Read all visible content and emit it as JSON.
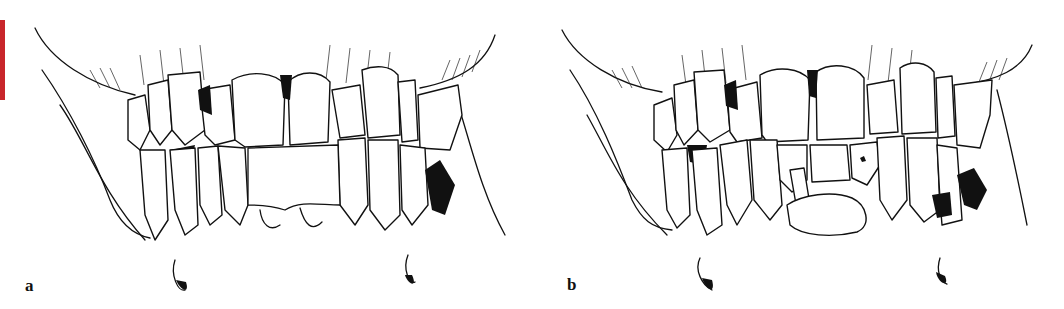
{
  "figure": {
    "accent_color": "#c8262b",
    "panels": [
      {
        "label": "a",
        "subject": "frontal-view-dentition-open-bite"
      },
      {
        "label": "b",
        "subject": "frontal-view-dentition-malpositioned-lower-incisors"
      }
    ]
  }
}
